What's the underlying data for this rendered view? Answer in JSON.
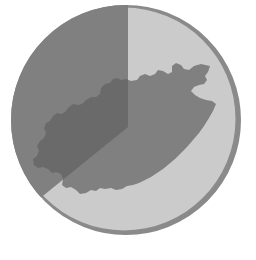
{
  "figure": {
    "title": "Pie chart circle with map silhouette overlay",
    "width": 256,
    "height": 260,
    "background_color": "#ffffff",
    "caption": ""
  },
  "colors": {
    "background": "#ffffff",
    "circle_fill": "#cbcbcb",
    "circle_rim": "#8a8a8a",
    "wedge_fill": "#808080",
    "map_fill": "#808080",
    "overlap_fill": "#6a6a6a"
  },
  "circle": {
    "label": "base-circle",
    "center_x": 126,
    "center_y": 120,
    "radius": 115,
    "rim_stroke_width": 7
  },
  "wedge": {
    "label": "pie-wedge",
    "apex_x": 128,
    "apex_y": 127,
    "start_angle_deg": 0,
    "end_angle_deg": 129,
    "sweep_deg": 129,
    "direction": "counterclockwise"
  },
  "map": {
    "label": "map-silhouette",
    "region_name": "",
    "orientation": "northeast-southwest elongated"
  },
  "chart_data": {
    "type": "pie",
    "title": "",
    "subtitle": "",
    "xlabel": "",
    "ylabel": "",
    "categories": [
      "Wedge",
      "Remainder"
    ],
    "values": [
      35.8,
      64.2
    ],
    "angles_deg": [
      129,
      231
    ],
    "colors": [
      "#808080",
      "#cbcbcb"
    ],
    "legend": [],
    "legend_position": "none",
    "grid": false,
    "annotations": [
      "map silhouette overlay"
    ]
  }
}
